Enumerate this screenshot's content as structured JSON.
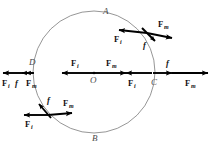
{
  "figure": {
    "background_color": "#ffffff",
    "circle_color": "#8a8a8a",
    "vector_color": "#000000"
  },
  "points": {
    "A": "A",
    "B": "B",
    "C": "C",
    "D": "D",
    "O": "O"
  },
  "labels": {
    "F": "F",
    "sub_i": "i",
    "sub_m": "m",
    "f": "f"
  },
  "clusters": {
    "center": {
      "name": "center-O",
      "point": "O",
      "forces": [
        {
          "symbol": "F",
          "subscript": "i",
          "direction": "left"
        },
        {
          "symbol": "F",
          "subscript": "m",
          "direction": "right"
        }
      ]
    },
    "left_D": {
      "name": "point-D",
      "point": "D",
      "forces": [
        {
          "symbol": "F",
          "subscript": "i",
          "direction": "left"
        },
        {
          "symbol": "f",
          "subscript": "",
          "direction": "left"
        },
        {
          "symbol": "F",
          "subscript": "m",
          "direction": "left"
        }
      ]
    },
    "right_C": {
      "name": "point-C",
      "point": "C",
      "forces": [
        {
          "symbol": "F",
          "subscript": "i",
          "direction": "left"
        },
        {
          "symbol": "f",
          "subscript": "",
          "direction": "right"
        },
        {
          "symbol": "F",
          "subscript": "m",
          "direction": "right"
        }
      ]
    },
    "upper_right": {
      "name": "upper-right-cluster",
      "forces": [
        {
          "symbol": "F",
          "subscript": "i",
          "direction": "left"
        },
        {
          "symbol": "F",
          "subscript": "m",
          "direction": "down-right"
        },
        {
          "symbol": "f",
          "subscript": "",
          "direction": "down-right"
        }
      ]
    },
    "lower_left": {
      "name": "lower-left-cluster",
      "forces": [
        {
          "symbol": "F",
          "subscript": "i",
          "direction": "left"
        },
        {
          "symbol": "F",
          "subscript": "m",
          "direction": "right"
        },
        {
          "symbol": "f",
          "subscript": "",
          "direction": "up-left"
        }
      ]
    }
  }
}
